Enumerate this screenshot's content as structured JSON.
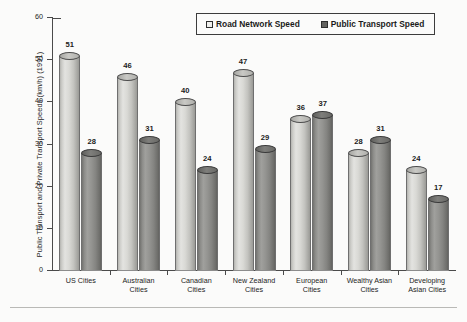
{
  "chart_data": {
    "type": "bar",
    "title": "",
    "subtitle": "",
    "xlabel": "",
    "ylabel": "Public Transport and Private Transport Speeds (km/h) (1991)",
    "categories": [
      "US Cities",
      "Australian Cities",
      "Canadian Cities",
      "New Zealand Cities",
      "European Cities",
      "Wealthy Asian Cities",
      "Developing Asian Cities"
    ],
    "category_lines": [
      [
        "US Cities"
      ],
      [
        "Australian",
        "Cities"
      ],
      [
        "Canadian",
        "Cities"
      ],
      [
        "New Zealand",
        "Cities"
      ],
      [
        "European",
        "Cities"
      ],
      [
        "Wealthy Asian",
        "Cities"
      ],
      [
        "Developing",
        "Asian Cities"
      ]
    ],
    "series": [
      {
        "name": "Road Network Speed",
        "color": "#d9d9d5",
        "values": [
          51,
          46,
          40,
          47,
          36,
          28,
          24
        ]
      },
      {
        "name": "Public Transport Speed",
        "color": "#8c8c89",
        "values": [
          28,
          31,
          24,
          29,
          37,
          31,
          17
        ]
      }
    ],
    "ylim": [
      0,
      60
    ],
    "yticks": [
      0,
      10,
      20,
      30,
      40,
      50,
      60
    ],
    "ytick_labels": [
      "0",
      "10",
      "20",
      "30",
      "40",
      "50",
      "60"
    ],
    "grid": false,
    "legend_position": "top-right",
    "bar_style": "3d-cylinder",
    "data_labels": true
  },
  "legend": {
    "items": [
      {
        "label": "Road Network Speed",
        "swatch": "light"
      },
      {
        "label": "Public Transport Speed",
        "swatch": "dark"
      }
    ]
  }
}
